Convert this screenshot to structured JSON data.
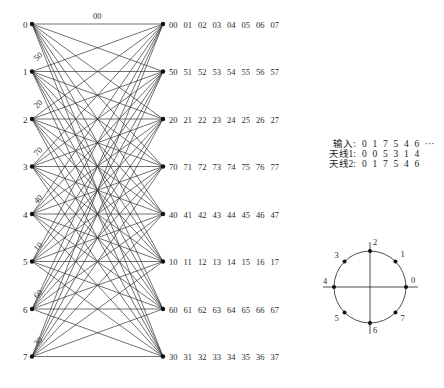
{
  "trellis": {
    "states": [
      "0",
      "1",
      "2",
      "3",
      "4",
      "5",
      "6",
      "7"
    ],
    "left_x": 32,
    "right_x": 163,
    "row_y": [
      24,
      71.5,
      119,
      166.5,
      214,
      261.5,
      309,
      356.5
    ],
    "edge_labels": [
      "00",
      "50",
      "20",
      "70",
      "40",
      "10",
      "60",
      "30"
    ],
    "output_rows": [
      [
        "00",
        "01",
        "02",
        "03",
        "04",
        "05",
        "06",
        "07"
      ],
      [
        "50",
        "51",
        "52",
        "53",
        "54",
        "55",
        "56",
        "57"
      ],
      [
        "20",
        "21",
        "22",
        "23",
        "24",
        "25",
        "26",
        "27"
      ],
      [
        "70",
        "71",
        "72",
        "73",
        "74",
        "75",
        "76",
        "77"
      ],
      [
        "40",
        "41",
        "42",
        "43",
        "44",
        "45",
        "46",
        "47"
      ],
      [
        "10",
        "11",
        "12",
        "13",
        "14",
        "15",
        "16",
        "17"
      ],
      [
        "60",
        "61",
        "62",
        "63",
        "64",
        "65",
        "66",
        "67"
      ],
      [
        "30",
        "31",
        "32",
        "33",
        "34",
        "35",
        "36",
        "37"
      ]
    ],
    "line_color": "#333333",
    "node_color": "#111111"
  },
  "legend": {
    "rows": [
      {
        "label": "输入:",
        "values": [
          "0",
          "1",
          "7",
          "5",
          "4",
          "6",
          "···"
        ]
      },
      {
        "label": "天线1:",
        "values": [
          "0",
          "0",
          "5",
          "3",
          "1",
          "4"
        ]
      },
      {
        "label": "天线2:",
        "values": [
          "0",
          "1",
          "7",
          "5",
          "4",
          "6"
        ]
      }
    ]
  },
  "constellation": {
    "type": "8-PSK",
    "center": [
      370,
      287
    ],
    "radius": 36,
    "points": [
      {
        "label": "0",
        "angle_deg": 0
      },
      {
        "label": "1",
        "angle_deg": 45
      },
      {
        "label": "2",
        "angle_deg": 90
      },
      {
        "label": "3",
        "angle_deg": 135
      },
      {
        "label": "4",
        "angle_deg": 180
      },
      {
        "label": "5",
        "angle_deg": 225
      },
      {
        "label": "6",
        "angle_deg": 270
      },
      {
        "label": "7",
        "angle_deg": 315
      }
    ]
  }
}
